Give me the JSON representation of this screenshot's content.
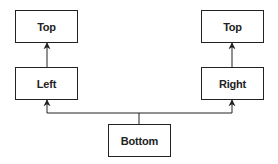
{
  "diagram": {
    "nodes": {
      "top_left": {
        "label": "Top"
      },
      "left": {
        "label": "Left"
      },
      "top_right": {
        "label": "Top"
      },
      "right": {
        "label": "Right"
      },
      "bottom": {
        "label": "Bottom"
      }
    },
    "edges": [
      {
        "from": "left",
        "to": "top_left"
      },
      {
        "from": "right",
        "to": "top_right"
      },
      {
        "from": "bottom",
        "to": "left"
      },
      {
        "from": "bottom",
        "to": "right"
      }
    ],
    "colors": {
      "stroke": "#222222",
      "background": "#ffffff"
    }
  }
}
